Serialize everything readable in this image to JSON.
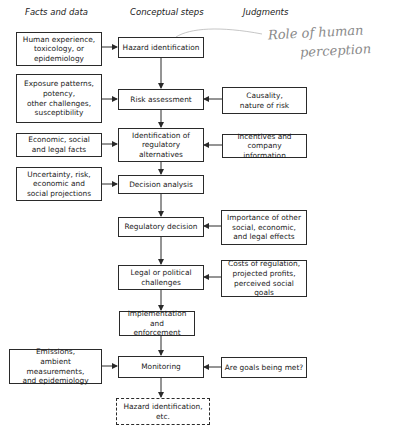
{
  "headers": {
    "facts": "Facts and data",
    "steps": "Conceptual steps",
    "judgments": "Judgments"
  },
  "annotation": {
    "line1": "Role of human",
    "line2": "perception"
  },
  "steps": [
    {
      "label": "Hazard identification"
    },
    {
      "label": "Risk assessment"
    },
    {
      "label": "Identification of\nregulatory\nalternatives"
    },
    {
      "label": "Decision analysis"
    },
    {
      "label": "Regulatory decision"
    },
    {
      "label": "Legal or political\nchallenges"
    },
    {
      "label": "Implementation and\nenforcement"
    },
    {
      "label": "Monitoring"
    },
    {
      "label": "Hazard identification,\netc.",
      "style": "dashed"
    }
  ],
  "facts": [
    {
      "label": "Human experience,\ntoxicology, or\nepidemiology",
      "feeds": "Hazard identification"
    },
    {
      "label": "Exposure patterns,\npotency,\nother challenges,\nsusceptibility",
      "feeds": "Risk assessment"
    },
    {
      "label": "Economic, social\nand legal facts",
      "feeds": "Identification of regulatory alternatives"
    },
    {
      "label": "Uncertainty, risk,\neconomic and\nsocial projections",
      "feeds": "Decision analysis"
    },
    {
      "label": "Emissions,\nambient measurements,\nand epidemiology",
      "feeds": "Monitoring"
    }
  ],
  "judgments": [
    {
      "label": "Causality,\nnature of risk",
      "feeds": "Risk assessment"
    },
    {
      "label": "Incentives and\ncompany information",
      "feeds": "Identification of regulatory alternatives"
    },
    {
      "label": "Importance of other\nsocial, economic,\nand legal effects",
      "feeds": "Regulatory decision"
    },
    {
      "label": "Costs of regulation,\nprojected profits,\nperceived social goals",
      "feeds": "Legal or political challenges"
    },
    {
      "label": "Are goals being met?",
      "feeds": "Monitoring"
    }
  ],
  "colors": {
    "line": "#2a2a2a",
    "annotation": "#8a8a8a"
  }
}
